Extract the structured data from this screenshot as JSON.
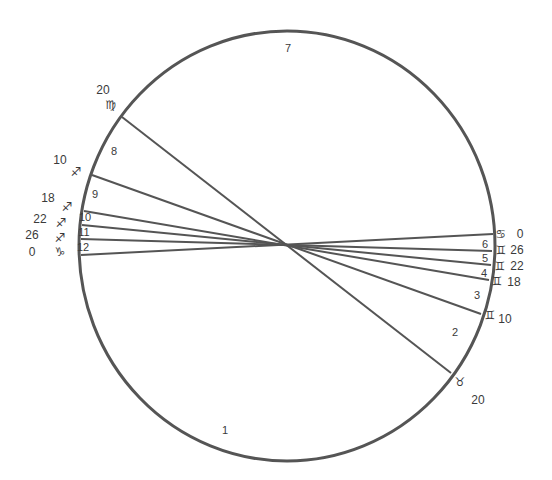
{
  "diagram": {
    "type": "astrological-house-chart",
    "colors": {
      "stroke": "#555555",
      "text": "#3a3a3a",
      "background": "#ffffff"
    },
    "circle": {
      "cx": 287,
      "cy": 246,
      "rx": 208,
      "ry": 215
    },
    "cusp_lines": [
      {
        "from_house": 8,
        "to_house": 2,
        "x1": 122,
        "y1": 117,
        "x2": 451,
        "y2": 373
      },
      {
        "from_house": 9,
        "to_house": 3,
        "x1": 92,
        "y1": 175,
        "x2": 481,
        "y2": 314
      },
      {
        "from_house": 10,
        "to_house": 4,
        "x1": 84,
        "y1": 211,
        "x2": 489,
        "y2": 280
      },
      {
        "from_house": 11,
        "to_house": 5,
        "x1": 82,
        "y1": 225,
        "x2": 491,
        "y2": 265
      },
      {
        "from_house": 12,
        "to_house": 6,
        "x1": 81,
        "y1": 239,
        "x2": 492,
        "y2": 251
      },
      {
        "from_house": 1,
        "to_house": 7,
        "x1": 81,
        "y1": 255,
        "x2": 493,
        "y2": 234
      }
    ],
    "house_numbers": [
      {
        "label": "1",
        "x": 225,
        "y": 434
      },
      {
        "label": "2",
        "x": 455,
        "y": 336
      },
      {
        "label": "3",
        "x": 477,
        "y": 299
      },
      {
        "label": "4",
        "x": 484,
        "y": 277
      },
      {
        "label": "5",
        "x": 485,
        "y": 262
      },
      {
        "label": "6",
        "x": 485,
        "y": 248
      },
      {
        "label": "7",
        "x": 288,
        "y": 52
      },
      {
        "label": "8",
        "x": 114,
        "y": 155
      },
      {
        "label": "9",
        "x": 95,
        "y": 198
      },
      {
        "label": "10",
        "x": 85,
        "y": 221
      },
      {
        "label": "11",
        "x": 84,
        "y": 236
      },
      {
        "label": "12",
        "x": 83,
        "y": 251
      }
    ],
    "cusp_labels": [
      {
        "house": 8,
        "degree": "20",
        "sign": "Virgo",
        "glyph": "♍",
        "deg_x": 103,
        "deg_y": 94,
        "sign_x": 111,
        "sign_y": 109
      },
      {
        "house": 9,
        "degree": "10",
        "sign": "Sagittarius",
        "glyph": "♐",
        "deg_x": 60,
        "deg_y": 164,
        "sign_x": 76,
        "sign_y": 176
      },
      {
        "house": 10,
        "degree": "18",
        "sign": "Sagittarius",
        "glyph": "♐",
        "deg_x": 48,
        "deg_y": 202,
        "sign_x": 67,
        "sign_y": 211
      },
      {
        "house": 11,
        "degree": "22",
        "sign": "Sagittarius",
        "glyph": "♐",
        "deg_x": 40,
        "deg_y": 223,
        "sign_x": 61,
        "sign_y": 227
      },
      {
        "house": 12,
        "degree": "26",
        "sign": "Sagittarius",
        "glyph": "♐",
        "deg_x": 32,
        "deg_y": 239,
        "sign_x": 60,
        "sign_y": 242
      },
      {
        "house": 1,
        "degree": "0",
        "sign": "Capricorn",
        "glyph": "♑",
        "deg_x": 32,
        "deg_y": 256,
        "sign_x": 60,
        "sign_y": 256
      },
      {
        "house": 7,
        "degree": "0",
        "sign": "Cancer",
        "glyph": "♋",
        "deg_x": 520,
        "deg_y": 238,
        "sign_x": 501,
        "sign_y": 238
      },
      {
        "house": 6,
        "degree": "26",
        "sign": "Gemini",
        "glyph": "♊",
        "deg_x": 517,
        "deg_y": 254,
        "sign_x": 501,
        "sign_y": 254
      },
      {
        "house": 5,
        "degree": "22",
        "sign": "Gemini",
        "glyph": "♊",
        "deg_x": 517,
        "deg_y": 270,
        "sign_x": 500,
        "sign_y": 270
      },
      {
        "house": 4,
        "degree": "18",
        "sign": "Gemini",
        "glyph": "♊",
        "deg_x": 514,
        "deg_y": 286,
        "sign_x": 497,
        "sign_y": 285
      },
      {
        "house": 3,
        "degree": "10",
        "sign": "Gemini",
        "glyph": "♊",
        "deg_x": 505,
        "deg_y": 323,
        "sign_x": 490,
        "sign_y": 319
      },
      {
        "house": 2,
        "degree": "20",
        "sign": "Taurus",
        "glyph": "♉",
        "deg_x": 478,
        "deg_y": 404,
        "sign_x": 460,
        "sign_y": 386
      }
    ]
  }
}
